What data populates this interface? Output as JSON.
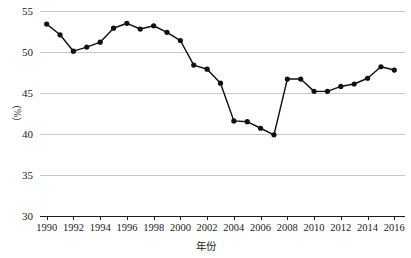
{
  "chart_data": {
    "type": "line",
    "title": "",
    "xlabel": "年份",
    "ylabel": "（%）",
    "x": [
      1990,
      1991,
      1992,
      1993,
      1994,
      1995,
      1996,
      1997,
      1998,
      1999,
      2000,
      2001,
      2002,
      2003,
      2004,
      2005,
      2006,
      2007,
      2008,
      2009,
      2010,
      2011,
      2012,
      2013,
      2014,
      2015,
      2016
    ],
    "values": [
      53.4,
      52.1,
      50.1,
      50.6,
      51.2,
      52.9,
      53.5,
      52.8,
      53.2,
      52.4,
      51.4,
      48.4,
      47.9,
      46.2,
      41.6,
      41.5,
      40.7,
      39.9,
      46.7,
      46.7,
      45.2,
      45.2,
      45.8,
      46.1,
      46.8,
      48.2,
      47.8
    ],
    "series": [
      {
        "name": "比例",
        "values": [
          53.4,
          52.1,
          50.1,
          50.6,
          51.2,
          52.9,
          53.5,
          52.8,
          53.2,
          52.4,
          51.4,
          48.4,
          47.9,
          46.2,
          41.6,
          41.5,
          40.7,
          39.9,
          46.7,
          46.7,
          45.2,
          45.2,
          45.8,
          46.1,
          46.8,
          48.2,
          47.8
        ]
      }
    ],
    "xlim": [
      1989.5,
      2016.8
    ],
    "ylim": [
      30,
      55
    ],
    "y_ticks": [
      30,
      35,
      40,
      45,
      50,
      55
    ],
    "y_tick_labels": [
      "30",
      "35",
      "40",
      "45",
      "50",
      "55"
    ],
    "x_ticks": [
      1990,
      1992,
      1994,
      1996,
      1998,
      2000,
      2002,
      2004,
      2006,
      2008,
      2010,
      2012,
      2014,
      2016
    ],
    "x_tick_labels": [
      "1990",
      "1992",
      "1994",
      "1996",
      "1998",
      "2000",
      "2002",
      "2004",
      "2006",
      "2008",
      "2010",
      "2012",
      "2014",
      "2016"
    ],
    "grid": "horizontal",
    "legend": "none",
    "marker": "circle",
    "colors": {
      "line": "#111111",
      "marker": "#111111",
      "grid": "#c8c8c8",
      "axis": "#1a1a1a",
      "background": "#ffffff",
      "text": "#1a1a1a"
    }
  }
}
